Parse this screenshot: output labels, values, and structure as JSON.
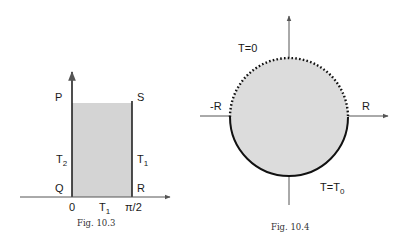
{
  "figures": [
    {
      "id": "fig-10-3",
      "caption": "Fig. 10.3",
      "labels": {
        "top_left": "P",
        "top_right": "S",
        "bottom_left": "Q",
        "bottom_right": "R",
        "left_side_base": "T",
        "left_side_sub": "2",
        "right_side_base": "T",
        "right_side_sub": "1",
        "bottom_side_base": "T",
        "bottom_side_sub": "1",
        "x_origin": "0",
        "x_end": "π/2"
      },
      "colors": {
        "fill": "#d4d4d4",
        "stroke": "#222222"
      }
    },
    {
      "id": "fig-10-4",
      "caption": "Fig. 10.4",
      "labels": {
        "upper_boundary": "T=0",
        "lower_boundary_base": "T=T",
        "lower_boundary_sub": "0",
        "left_axis": "-R",
        "right_axis": "R"
      },
      "colors": {
        "fill": "#dcdcdc",
        "stroke": "#111111"
      }
    }
  ]
}
